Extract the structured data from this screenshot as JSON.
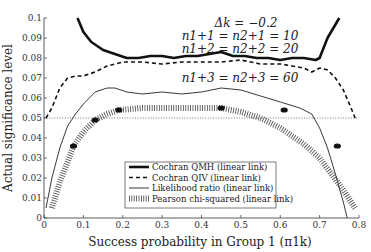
{
  "chart_data": {
    "type": "line",
    "title": "",
    "xlabel": "Success probability in Group 1 (π1k)",
    "ylabel": "Actual significance level",
    "xlim": [
      0,
      0.8
    ],
    "ylim": [
      0,
      0.1
    ],
    "xticks": [
      "0",
      "0.1",
      "0.2",
      "0.3",
      "0.4",
      "0.5",
      "0.6",
      "0.7",
      "0.8"
    ],
    "yticks": [
      "0",
      "0.01",
      "0.02",
      "0.03",
      "0.04",
      "0.05",
      "0.06",
      "0.07",
      "0.08",
      "0.09",
      "0.1"
    ],
    "grid": false,
    "reference_line": {
      "y": 0.05,
      "style": "dotted"
    },
    "annotations": [
      "Δk = −0.2",
      "n1+1 = n2+1 = 10",
      "n1+2 = n2+2 = 20",
      "n1+3 = n2+3 = 60"
    ],
    "legend_position": "lower center",
    "series": [
      {
        "name": "Cochran QMH (linear link)",
        "style": "thick-solid",
        "x": [
          0.085,
          0.1,
          0.12,
          0.15,
          0.18,
          0.21,
          0.24,
          0.27,
          0.3,
          0.33,
          0.36,
          0.39,
          0.42,
          0.45,
          0.48,
          0.51,
          0.54,
          0.57,
          0.6,
          0.63,
          0.66,
          0.69,
          0.7,
          0.72,
          0.75
        ],
        "y": [
          0.1,
          0.093,
          0.088,
          0.084,
          0.082,
          0.08,
          0.08,
          0.081,
          0.081,
          0.08,
          0.081,
          0.081,
          0.082,
          0.083,
          0.081,
          0.081,
          0.08,
          0.08,
          0.079,
          0.08,
          0.08,
          0.079,
          0.08,
          0.09,
          0.1
        ]
      },
      {
        "name": "Cochran QIV (linear link)",
        "style": "dashed",
        "x": [
          0.005,
          0.02,
          0.04,
          0.06,
          0.08,
          0.1,
          0.13,
          0.16,
          0.2,
          0.25,
          0.3,
          0.35,
          0.4,
          0.45,
          0.5,
          0.55,
          0.6,
          0.63,
          0.66,
          0.68,
          0.7,
          0.72,
          0.74,
          0.76,
          0.78,
          0.79
        ],
        "y": [
          0.05,
          0.055,
          0.065,
          0.07,
          0.071,
          0.071,
          0.073,
          0.076,
          0.078,
          0.078,
          0.077,
          0.078,
          0.078,
          0.078,
          0.079,
          0.077,
          0.077,
          0.076,
          0.075,
          0.073,
          0.075,
          0.074,
          0.07,
          0.064,
          0.055,
          0.05
        ]
      },
      {
        "name": "Likelihood ratio (linear link)",
        "style": "thin-solid",
        "x": [
          0.005,
          0.02,
          0.04,
          0.06,
          0.08,
          0.1,
          0.13,
          0.16,
          0.18,
          0.21,
          0.25,
          0.3,
          0.35,
          0.4,
          0.45,
          0.5,
          0.55,
          0.6,
          0.65,
          0.68,
          0.7,
          0.72,
          0.74,
          0.76,
          0.77
        ],
        "y": [
          0.005,
          0.02,
          0.035,
          0.046,
          0.052,
          0.057,
          0.063,
          0.065,
          0.065,
          0.063,
          0.062,
          0.063,
          0.062,
          0.063,
          0.065,
          0.064,
          0.061,
          0.058,
          0.055,
          0.052,
          0.045,
          0.035,
          0.022,
          0.008,
          0.0
        ]
      },
      {
        "name": "Pearson chi-squared (linear link)",
        "style": "hatched",
        "x": [
          0.02,
          0.04,
          0.06,
          0.075,
          0.1,
          0.13,
          0.16,
          0.19,
          0.25,
          0.3,
          0.35,
          0.4,
          0.45,
          0.5,
          0.55,
          0.6,
          0.63,
          0.66,
          0.7,
          0.73,
          0.76,
          0.78,
          0.79
        ],
        "y": [
          0.005,
          0.018,
          0.028,
          0.036,
          0.043,
          0.049,
          0.052,
          0.054,
          0.055,
          0.055,
          0.055,
          0.055,
          0.055,
          0.053,
          0.05,
          0.045,
          0.041,
          0.037,
          0.03,
          0.022,
          0.014,
          0.008,
          0.005
        ]
      }
    ],
    "markers": [
      {
        "x": 0.075,
        "y": 0.036
      },
      {
        "x": 0.13,
        "y": 0.049
      },
      {
        "x": 0.19,
        "y": 0.054
      },
      {
        "x": 0.45,
        "y": 0.055
      },
      {
        "x": 0.61,
        "y": 0.054
      },
      {
        "x": 0.745,
        "y": 0.036
      }
    ]
  }
}
